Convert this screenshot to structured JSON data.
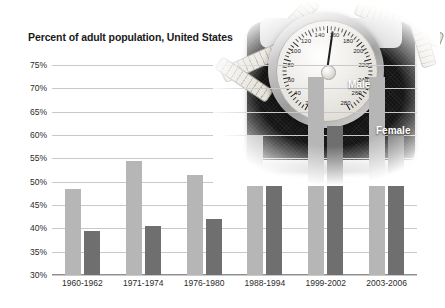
{
  "chart_data": {
    "type": "bar",
    "title": "Percent of adult population, United States",
    "xlabel": "",
    "ylabel": "",
    "ylim": [
      30,
      75
    ],
    "ytick_step": 5,
    "ytick_labels": [
      "75%",
      "70%",
      "65%",
      "60%",
      "55%",
      "50%",
      "45%",
      "40%",
      "35%",
      "30%"
    ],
    "ytick_values": [
      75,
      70,
      65,
      60,
      55,
      50,
      45,
      40,
      35,
      30
    ],
    "grid": true,
    "legend_position": "inside-right",
    "categories": [
      "1960-1962",
      "1971-1974",
      "1976-1980",
      "1988-1994",
      "1999-2002",
      "2003-2006"
    ],
    "series": [
      {
        "name": "Male",
        "color": "#b6b6b6",
        "values": [
          48.5,
          54.5,
          51.5,
          60.0,
          72.5,
          72.5
        ]
      },
      {
        "name": "Female",
        "color": "#6f6f6f",
        "values": [
          39.5,
          40.5,
          42.0,
          50.0,
          62.0,
          60.8
        ]
      }
    ],
    "annotations": [
      {
        "text": "Male",
        "series": "Male"
      },
      {
        "text": "Female",
        "series": "Female"
      }
    ]
  },
  "photo": {
    "name": "bathroom-scale-photo",
    "dial_numbers": [
      "20",
      "40",
      "60",
      "80",
      "100",
      "120",
      "140",
      "160",
      "180",
      "200",
      "220",
      "240",
      "260",
      "280"
    ]
  }
}
